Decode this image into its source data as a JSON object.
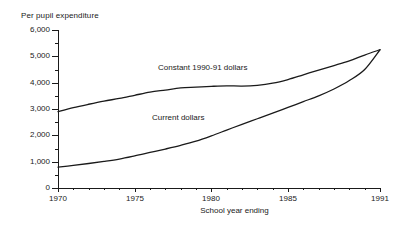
{
  "chart_data": {
    "type": "line",
    "title": "",
    "ylabel": "Per pupil expenditure",
    "xlabel": "School year ending",
    "xlim": [
      1970,
      1991
    ],
    "ylim": [
      0,
      6000
    ],
    "grid": false,
    "legend": "inline-annotations",
    "x": [
      1970,
      1971,
      1972,
      1973,
      1974,
      1975,
      1976,
      1977,
      1978,
      1979,
      1980,
      1981,
      1982,
      1983,
      1984,
      1985,
      1986,
      1987,
      1988,
      1989,
      1990,
      1991
    ],
    "series": [
      {
        "name": "Constant 1990-91 dollars",
        "values": [
          2900,
          3050,
          3180,
          3300,
          3400,
          3520,
          3640,
          3720,
          3800,
          3830,
          3860,
          3880,
          3870,
          3900,
          3980,
          4120,
          4300,
          4480,
          4650,
          4830,
          5050,
          5250
        ]
      },
      {
        "name": "Current dollars",
        "values": [
          790,
          860,
          930,
          1010,
          1100,
          1220,
          1350,
          1480,
          1620,
          1780,
          1980,
          2200,
          2420,
          2630,
          2840,
          3060,
          3280,
          3500,
          3760,
          4080,
          4500,
          5250
        ]
      }
    ],
    "y_tick_labels": [
      "6,000",
      "5,000",
      "4,000",
      "3,000",
      "2,000",
      "1,000",
      "0"
    ],
    "y_tick_values": [
      6000,
      5000,
      4000,
      3000,
      2000,
      1000,
      0
    ],
    "y_minor_tick_values": [
      5500,
      4500,
      3500,
      2500,
      1500,
      500
    ],
    "x_tick_labels": [
      "1970",
      "1975",
      "1980",
      "1985",
      "1991"
    ],
    "x_tick_values": [
      1970,
      1975,
      1980,
      1985,
      1991
    ],
    "x_minor_tick_values": [
      1971,
      1972,
      1973,
      1974,
      1976,
      1977,
      1978,
      1979,
      1981,
      1982,
      1983,
      1984,
      1986,
      1987,
      1988,
      1989,
      1990
    ],
    "line_color": "#1a1a1a",
    "background_color": "#ffffff"
  },
  "annotations": {
    "constant_label": "Constant 1990-91 dollars",
    "current_label": "Current dollars"
  },
  "axes": {
    "y_title": "Per pupil expenditure",
    "x_title": "School year ending"
  }
}
